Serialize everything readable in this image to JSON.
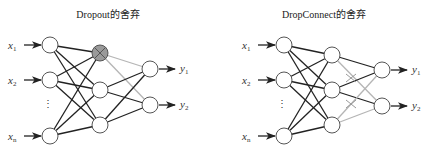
{
  "panels": [
    {
      "title": "Dropout的舍弃",
      "inputs": [
        "x1",
        "x2",
        "xn"
      ],
      "outputs": [
        "y1",
        "y2"
      ],
      "dropped_node": "hidden-1",
      "description": "Hidden node 1 is dropped (shaded with X); its outgoing connections shown grey"
    },
    {
      "title": "DropConnect的舍弃",
      "inputs": [
        "x1",
        "x2",
        "xn"
      ],
      "outputs": [
        "y1",
        "y2"
      ],
      "dropped_connections": [
        "h1-y2",
        "h2-... (crossed)",
        "h3-y1"
      ],
      "description": "Individual hidden-to-output connections dropped (grey lines with X marks)"
    }
  ],
  "colors": {
    "line": "#222222",
    "dropped_line": "#b5b5b5",
    "dropped_node_fill": "#9a9a9a",
    "node_fill": "#ffffff"
  }
}
